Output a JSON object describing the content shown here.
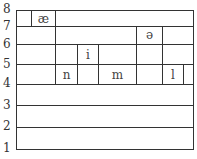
{
  "diagram": {
    "y_axis": {
      "labels": [
        "8",
        "7",
        "6",
        "5",
        "4",
        "3",
        "2",
        "1"
      ]
    },
    "segments": [
      {
        "symbol": "æ",
        "bottom": 7,
        "top": 8
      },
      {
        "symbol": "n",
        "bottom": 4,
        "top": 5
      },
      {
        "symbol": "i",
        "bottom": 4,
        "top": 6
      },
      {
        "symbol": "m",
        "bottom": 4,
        "top": 5
      },
      {
        "symbol": "ə",
        "bottom": 4,
        "top": 7
      },
      {
        "symbol": "l",
        "bottom": 4,
        "top": 5
      }
    ]
  }
}
